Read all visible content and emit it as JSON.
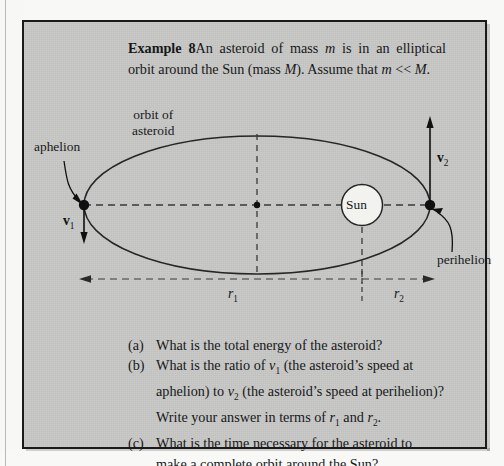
{
  "example": {
    "label": "Example 8",
    "statement_part1": "An asteroid of mass ",
    "statement_m1": "m",
    "statement_part2": " is in an elliptical orbit around the Sun (mass ",
    "statement_M": "M",
    "statement_part3": "). Assume that ",
    "statement_m2": "m",
    "statement_part4": " << ",
    "statement_M2": "M",
    "statement_part5": "."
  },
  "diagram": {
    "orbit_label_line1": "orbit of",
    "orbit_label_line2": "asteroid",
    "aphelion_label": "aphelion",
    "perihelion_label": "perihelion",
    "sun_label": "Sun",
    "v1_label": "v",
    "v1_sub": "1",
    "v2_label": "v",
    "v2_sub": "2",
    "r1_label": "r",
    "r1_sub": "1",
    "r2_label": "r",
    "r2_sub": "2"
  },
  "questions": [
    {
      "marker": "(a)",
      "text": "What is the total energy of the asteroid?"
    },
    {
      "marker": "(b)",
      "text": "What is the ratio of v1 (the asteroid's speed at aphelion) to v2 (the asteroid's speed at perihelion)? Write your answer in terms of r1 and r2."
    },
    {
      "marker": "(c)",
      "text": "What is the time necessary for the asteroid to make a complete orbit around the Sun?"
    }
  ],
  "colors": {
    "panel": "#c8c8c6",
    "border": "#1a1a1a",
    "ink": "#16181a",
    "sun_fill": "#f2f2ef"
  }
}
